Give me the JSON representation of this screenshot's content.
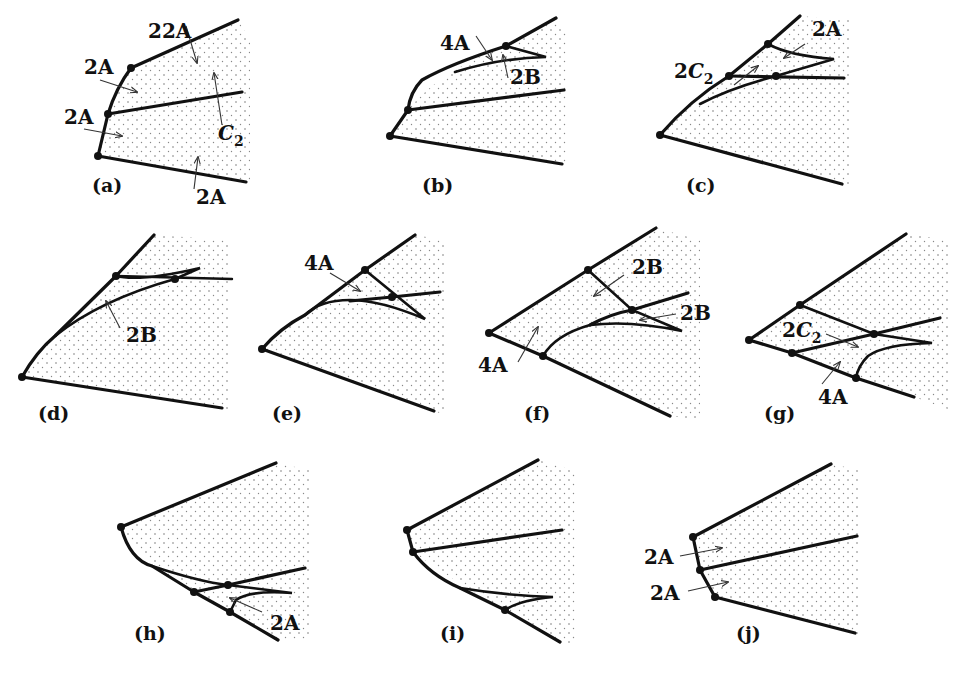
{
  "figure": {
    "panels": [
      {
        "id": "a",
        "caption": "(a)",
        "labels": [
          {
            "text": "2A",
            "x": 148,
            "y": 38
          },
          {
            "text": "2A",
            "x": 84,
            "y": 74
          },
          {
            "text": "2A",
            "x": 64,
            "y": 124
          },
          {
            "text": "C",
            "sub": "2",
            "x": 218,
            "y": 140
          },
          {
            "text": "2A",
            "x": 196,
            "y": 190
          }
        ]
      },
      {
        "id": "b",
        "caption": "(b)",
        "labels": [
          {
            "text": "4A",
            "x": 440,
            "y": 50
          },
          {
            "text": "2B",
            "x": 510,
            "y": 82
          }
        ]
      },
      {
        "id": "c",
        "caption": "(c)",
        "labels": [
          {
            "text": "2A",
            "x": 812,
            "y": 36
          },
          {
            "text": "C",
            "prefix": "2",
            "sub": "2",
            "x": 676,
            "y": 78
          }
        ]
      },
      {
        "id": "d",
        "caption": "(d)",
        "labels": [
          {
            "text": "2B",
            "x": 126,
            "y": 342
          }
        ]
      },
      {
        "id": "e",
        "caption": "(e)",
        "labels": [
          {
            "text": "4A",
            "x": 304,
            "y": 270
          }
        ]
      },
      {
        "id": "f",
        "caption": "(f)",
        "labels": [
          {
            "text": "2B",
            "x": 632,
            "y": 274
          },
          {
            "text": "2B",
            "x": 680,
            "y": 320
          },
          {
            "text": "4A",
            "x": 480,
            "y": 370
          }
        ]
      },
      {
        "id": "g",
        "caption": "(g)",
        "labels": [
          {
            "text": "C",
            "prefix": "2",
            "sub": "2",
            "x": 786,
            "y": 336
          },
          {
            "text": "4A",
            "x": 820,
            "y": 404
          }
        ]
      },
      {
        "id": "h",
        "caption": "(h)",
        "labels": [
          {
            "text": "2A",
            "x": 270,
            "y": 630
          }
        ]
      },
      {
        "id": "i",
        "caption": "(i)",
        "labels": []
      },
      {
        "id": "j",
        "caption": "(j)",
        "labels": [
          {
            "text": "2A",
            "x": 644,
            "y": 564
          },
          {
            "text": "2A",
            "x": 650,
            "y": 600
          }
        ]
      }
    ],
    "captions": {
      "a": "(a)",
      "b": "(b)",
      "c": "(c)",
      "d": "(d)",
      "e": "(e)",
      "f": "(f)",
      "g": "(g)",
      "h": "(h)",
      "i": "(i)",
      "j": "(j)"
    },
    "label_texts": {
      "two_a": "2A",
      "four_a": "4A",
      "two_b": "2B",
      "c": "C",
      "two": "2",
      "sub_two": "2"
    }
  }
}
